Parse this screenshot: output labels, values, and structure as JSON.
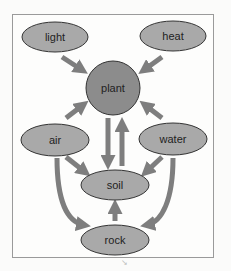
{
  "diagram": {
    "nodes": {
      "light": "light",
      "heat": "heat",
      "plant": "plant",
      "air": "air",
      "water": "water",
      "soil": "soil",
      "rock": "rock"
    },
    "edges": [
      {
        "from": "light",
        "to": "plant"
      },
      {
        "from": "heat",
        "to": "plant"
      },
      {
        "from": "air",
        "to": "plant"
      },
      {
        "from": "water",
        "to": "plant"
      },
      {
        "from": "plant",
        "to": "soil"
      },
      {
        "from": "soil",
        "to": "plant"
      },
      {
        "from": "air",
        "to": "soil"
      },
      {
        "from": "water",
        "to": "soil"
      },
      {
        "from": "air",
        "to": "rock"
      },
      {
        "from": "water",
        "to": "rock"
      },
      {
        "from": "rock",
        "to": "soil"
      }
    ],
    "colors": {
      "node_fill": "#a9a9a9",
      "plant_fill": "#8c8c8c",
      "arrow": "#7e7e7e",
      "stroke": "#333333"
    }
  },
  "footer_mark": "↘"
}
